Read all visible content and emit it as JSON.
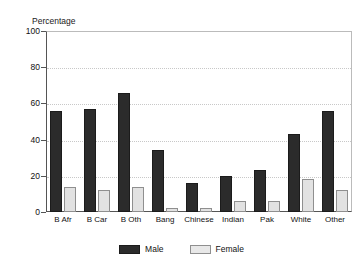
{
  "figure": {
    "clipped_title_remnant": "",
    "y_axis_title": "Percentage"
  },
  "legend": {
    "position": "bottom-center",
    "items": [
      {
        "label": "Male",
        "swatch": "dark-filled-square",
        "color": "#2b2b2b"
      },
      {
        "label": "Female",
        "swatch": "light-filled-square",
        "color": "#e8e8e8"
      }
    ]
  },
  "chart_data": {
    "type": "bar",
    "title": "",
    "xlabel": "",
    "ylabel": "Percentage",
    "ylim": [
      0,
      100
    ],
    "yticks": [
      0,
      20,
      40,
      60,
      80,
      100
    ],
    "grid": "horizontal-dotted",
    "legend_position": "bottom-center",
    "categories": [
      "B Afr",
      "B Car",
      "B Oth",
      "Bang",
      "Chinese",
      "Indian",
      "Pak",
      "White",
      "Other"
    ],
    "series": [
      {
        "name": "Male",
        "color": "#2b2b2b",
        "values": [
          56,
          57,
          66,
          34,
          16,
          20,
          23,
          43,
          56
        ]
      },
      {
        "name": "Female",
        "color": "#e8e8e8",
        "values": [
          14,
          12,
          14,
          2,
          2,
          6,
          6,
          18,
          12
        ]
      }
    ]
  }
}
